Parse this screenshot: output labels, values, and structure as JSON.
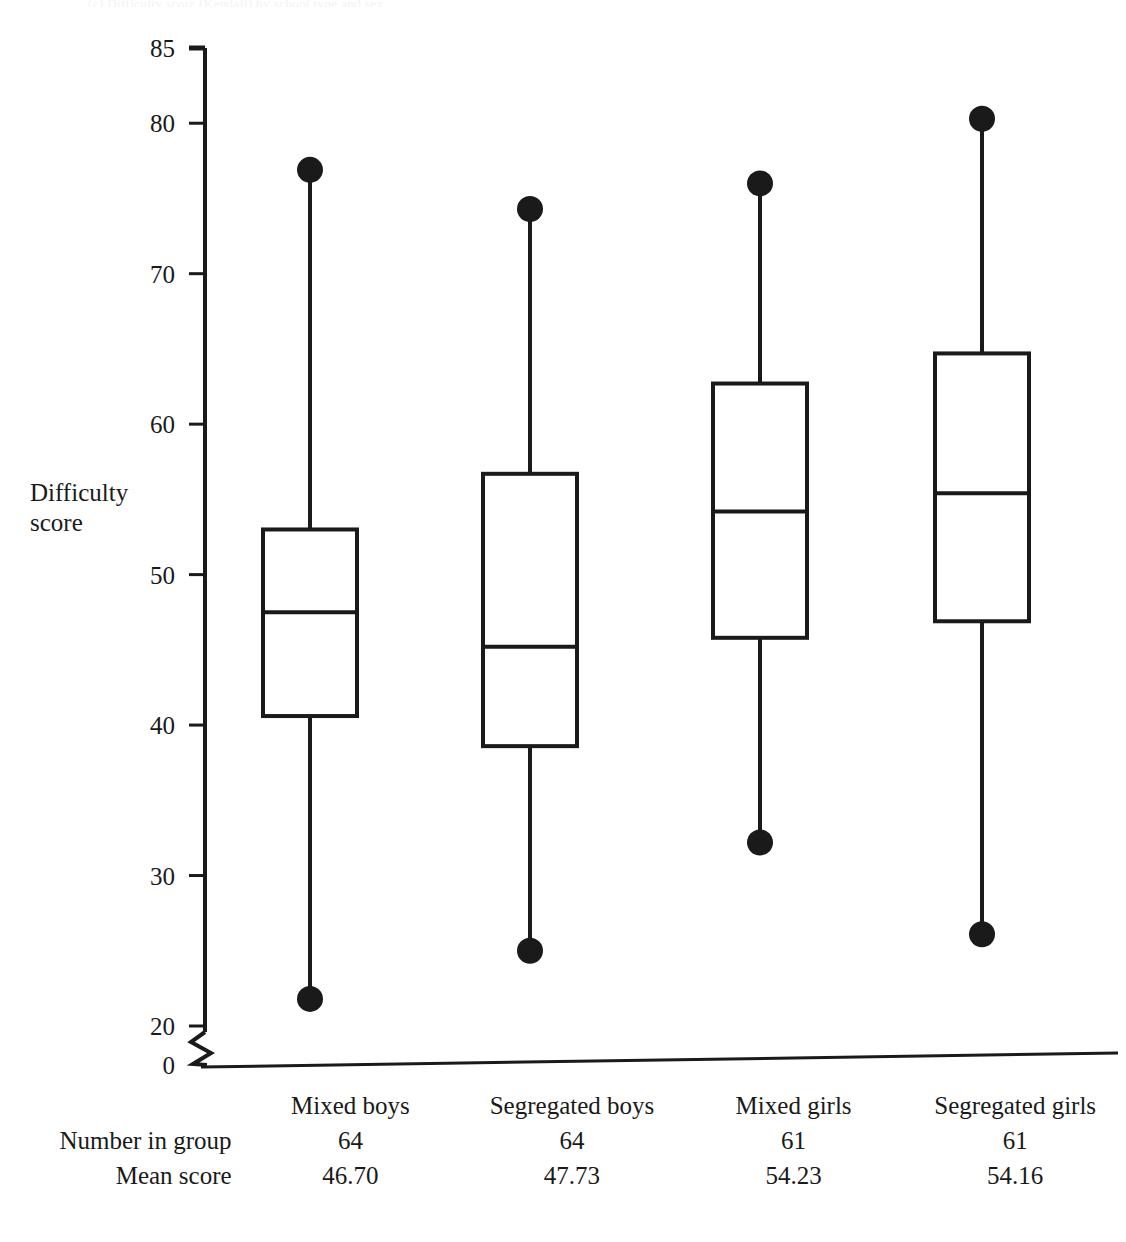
{
  "figure": {
    "top_caption": "(c) Difficulty score (Kendall) by school type and sex",
    "ylabel_line1": "Difficulty",
    "ylabel_line2": "score",
    "ink_color": "#1a1a1a",
    "background": "#ffffff"
  },
  "axis": {
    "ticks": [
      "85",
      "80",
      "70",
      "60",
      "50",
      "40",
      "30",
      "20",
      "0"
    ],
    "has_axis_break": true,
    "break_between": [
      "20",
      "0"
    ]
  },
  "table": {
    "row_labels": [
      "",
      "Number in group",
      "Mean score"
    ],
    "group_names": [
      "Mixed boys",
      "Segregated boys",
      "Mixed girls",
      "Segregated girls"
    ],
    "counts": [
      "64",
      "64",
      "61",
      "61"
    ],
    "means": [
      "46.70",
      "47.73",
      "54.23",
      "54.16"
    ]
  },
  "chart_data": {
    "type": "box",
    "title": "(c) Difficulty score (Kendall) by school type and sex",
    "xlabel": "",
    "ylabel": "Difficulty score",
    "ylim": [
      20,
      85
    ],
    "yticks": [
      20,
      30,
      40,
      50,
      60,
      70,
      80,
      85
    ],
    "axis_break_below": 20,
    "grid": false,
    "legend": "none",
    "whisker_cap_style": "filled-circle",
    "categories": [
      "Mixed boys",
      "Segregated boys",
      "Mixed girls",
      "Segregated girls"
    ],
    "n": [
      64,
      64,
      61,
      61
    ],
    "mean": [
      46.7,
      47.73,
      54.23,
      54.16
    ],
    "boxes": [
      {
        "category": "Mixed boys",
        "min": 21.8,
        "q1": 40.6,
        "median": 47.5,
        "q3": 53.0,
        "max": 76.9
      },
      {
        "category": "Segregated boys",
        "min": 25.0,
        "q1": 38.6,
        "median": 45.2,
        "q3": 56.7,
        "max": 74.3
      },
      {
        "category": "Mixed girls",
        "min": 32.2,
        "q1": 45.8,
        "median": 54.2,
        "q3": 62.7,
        "max": 76.0
      },
      {
        "category": "Segregated girls",
        "min": 26.1,
        "q1": 46.9,
        "median": 55.4,
        "q3": 64.7,
        "max": 80.3
      }
    ]
  }
}
